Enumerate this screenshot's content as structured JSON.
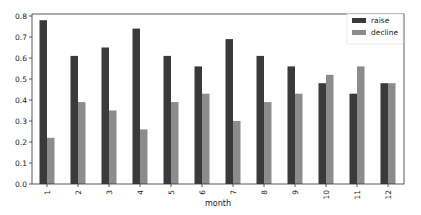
{
  "chart_data": {
    "type": "bar",
    "title": "",
    "xlabel": "month",
    "ylabel": "",
    "categories": [
      "1",
      "2",
      "3",
      "4",
      "5",
      "6",
      "7",
      "8",
      "9",
      "10",
      "11",
      "12"
    ],
    "series": [
      {
        "name": "raise",
        "color": "#3a3a3a",
        "values": [
          0.78,
          0.61,
          0.65,
          0.74,
          0.61,
          0.56,
          0.69,
          0.61,
          0.56,
          0.48,
          0.43,
          0.48
        ]
      },
      {
        "name": "decline",
        "color": "#8c8c8c",
        "values": [
          0.22,
          0.39,
          0.35,
          0.26,
          0.39,
          0.43,
          0.3,
          0.39,
          0.43,
          0.52,
          0.56,
          0.48
        ]
      }
    ],
    "ylim": [
      0,
      0.82
    ],
    "yticks": [
      "0.0",
      "0.1",
      "0.2",
      "0.3",
      "0.4",
      "0.5",
      "0.6",
      "0.7",
      "0.8"
    ],
    "xtick_rotation": 90,
    "grid": false,
    "legend_position": "upper right"
  }
}
